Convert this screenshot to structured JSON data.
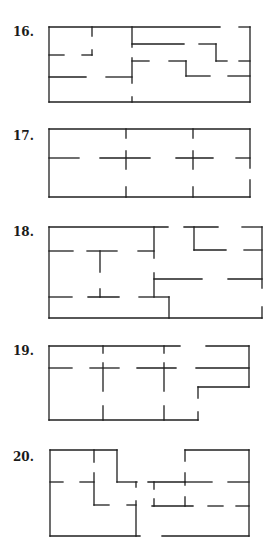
{
  "figures": [
    {
      "number": "16.",
      "label_y": 26,
      "walls": [
        [
          49,
          27,
          220,
          27
        ],
        [
          239,
          27,
          250,
          27
        ],
        [
          250,
          27,
          250,
          102
        ],
        [
          49,
          102,
          250,
          102
        ],
        [
          49,
          27,
          49,
          102
        ],
        [
          92,
          27,
          92,
          36
        ],
        [
          49,
          55,
          64,
          55
        ],
        [
          82,
          55,
          92,
          55
        ],
        [
          92,
          50,
          92,
          55
        ],
        [
          49,
          77,
          86,
          77
        ],
        [
          106,
          77,
          132,
          77
        ],
        [
          132,
          27,
          132,
          47
        ],
        [
          132,
          58,
          132,
          83
        ],
        [
          132,
          97,
          132,
          102
        ],
        [
          132,
          44,
          184,
          44
        ],
        [
          199,
          44,
          216,
          44
        ],
        [
          216,
          44,
          216,
          61
        ],
        [
          216,
          61,
          227,
          61
        ],
        [
          239,
          61,
          250,
          61
        ],
        [
          132,
          61,
          149,
          61
        ],
        [
          169,
          61,
          186,
          61
        ],
        [
          186,
          61,
          186,
          76
        ],
        [
          186,
          76,
          210,
          76
        ],
        [
          228,
          76,
          250,
          76
        ]
      ]
    },
    {
      "number": "17.",
      "label_y": 130,
      "walls": [
        [
          49,
          129,
          250,
          129
        ],
        [
          49,
          197,
          250,
          197
        ],
        [
          49,
          129,
          49,
          197
        ],
        [
          250,
          129,
          250,
          168
        ],
        [
          250,
          180,
          250,
          197
        ],
        [
          49,
          158,
          79,
          158
        ],
        [
          100,
          158,
          150,
          158
        ],
        [
          176,
          158,
          213,
          158
        ],
        [
          236,
          158,
          250,
          158
        ],
        [
          126,
          129,
          126,
          138
        ],
        [
          126,
          151,
          126,
          169
        ],
        [
          126,
          187,
          126,
          197
        ],
        [
          193,
          129,
          193,
          138
        ],
        [
          193,
          151,
          193,
          169
        ],
        [
          193,
          187,
          193,
          197
        ]
      ]
    },
    {
      "number": "18.",
      "label_y": 226,
      "walls": [
        [
          49,
          227,
          168,
          227
        ],
        [
          184,
          227,
          218,
          227
        ],
        [
          242,
          227,
          262,
          227
        ],
        [
          49,
          227,
          49,
          318
        ],
        [
          49,
          318,
          262,
          318
        ],
        [
          262,
          227,
          262,
          288
        ],
        [
          262,
          307,
          262,
          318
        ],
        [
          49,
          251,
          73,
          251
        ],
        [
          87,
          251,
          117,
          251
        ],
        [
          100,
          251,
          100,
          272
        ],
        [
          138,
          251,
          154,
          251
        ],
        [
          154,
          227,
          154,
          258
        ],
        [
          154,
          273,
          154,
          297
        ],
        [
          194,
          227,
          194,
          250
        ],
        [
          194,
          250,
          226,
          250
        ],
        [
          244,
          250,
          262,
          250
        ],
        [
          154,
          279,
          202,
          279
        ],
        [
          228,
          279,
          262,
          279
        ],
        [
          49,
          297,
          72,
          297
        ],
        [
          88,
          297,
          119,
          297
        ],
        [
          100,
          289,
          100,
          297
        ],
        [
          139,
          297,
          169,
          297
        ],
        [
          169,
          297,
          169,
          318
        ]
      ]
    },
    {
      "number": "19.",
      "label_y": 345,
      "walls": [
        [
          49,
          346,
          180,
          346
        ],
        [
          206,
          346,
          249,
          346
        ],
        [
          249,
          346,
          249,
          387
        ],
        [
          198,
          387,
          249,
          387
        ],
        [
          198,
          387,
          198,
          398
        ],
        [
          198,
          412,
          198,
          420
        ],
        [
          49,
          420,
          198,
          420
        ],
        [
          49,
          346,
          49,
          420
        ],
        [
          49,
          368,
          72,
          368
        ],
        [
          90,
          368,
          119,
          368
        ],
        [
          137,
          368,
          176,
          368
        ],
        [
          196,
          368,
          249,
          368
        ],
        [
          103,
          346,
          103,
          353
        ],
        [
          103,
          363,
          103,
          391
        ],
        [
          103,
          406,
          103,
          420
        ],
        [
          164,
          346,
          164,
          353
        ],
        [
          164,
          363,
          164,
          391
        ],
        [
          164,
          406,
          164,
          420
        ]
      ]
    },
    {
      "number": "20.",
      "label_y": 451,
      "walls": [
        [
          50,
          450,
          117,
          450
        ],
        [
          117,
          450,
          117,
          482
        ],
        [
          117,
          482,
          137,
          482
        ],
        [
          136,
          482,
          136,
          487
        ],
        [
          50,
          450,
          50,
          536
        ],
        [
          50,
          536,
          140,
          536
        ],
        [
          94,
          450,
          94,
          462
        ],
        [
          94,
          473,
          94,
          505
        ],
        [
          94,
          505,
          109,
          505
        ],
        [
          50,
          482,
          63,
          482
        ],
        [
          80,
          482,
          94,
          482
        ],
        [
          127,
          505,
          136,
          505
        ],
        [
          136,
          501,
          136,
          536
        ],
        [
          148,
          482,
          185,
          482
        ],
        [
          154,
          482,
          154,
          489
        ],
        [
          185,
          450,
          185,
          461
        ],
        [
          185,
          473,
          185,
          485
        ],
        [
          185,
          450,
          249,
          450
        ],
        [
          249,
          450,
          249,
          536
        ],
        [
          185,
          482,
          212,
          482
        ],
        [
          228,
          482,
          249,
          482
        ],
        [
          152,
          506,
          193,
          506
        ],
        [
          154,
          499,
          154,
          506
        ],
        [
          185,
          497,
          185,
          506
        ],
        [
          208,
          506,
          223,
          506
        ],
        [
          236,
          506,
          249,
          506
        ],
        [
          162,
          536,
          249,
          536
        ]
      ]
    }
  ]
}
